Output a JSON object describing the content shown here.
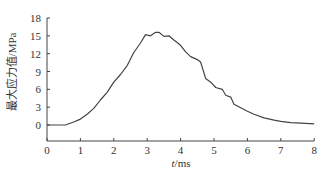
{
  "chart_data": {
    "type": "line",
    "title": "",
    "xlabel": "t/ms",
    "xlabel_italic_part": "t",
    "xlabel_rest": "/ms",
    "ylabel": "最大应力值/MPa",
    "xlim": [
      0,
      8
    ],
    "ylim": [
      -3,
      18
    ],
    "x_ticks": [
      0,
      1,
      2,
      3,
      4,
      5,
      6,
      7,
      8
    ],
    "y_ticks": [
      0,
      3,
      6,
      9,
      12,
      15,
      18
    ],
    "grid": false,
    "legend": null,
    "line_color": "#444444",
    "series": [
      {
        "name": "最大应力值",
        "x": [
          0,
          0.55,
          0.8,
          1.0,
          1.2,
          1.4,
          1.6,
          1.8,
          2.0,
          2.2,
          2.4,
          2.6,
          2.8,
          2.95,
          3.1,
          3.25,
          3.35,
          3.5,
          3.65,
          3.8,
          4.0,
          4.15,
          4.3,
          4.5,
          4.6,
          4.75,
          4.9,
          5.05,
          5.25,
          5.35,
          5.5,
          5.6,
          5.8,
          6.0,
          6.2,
          6.5,
          6.8,
          7.0,
          7.3,
          7.6,
          8.0
        ],
        "values": [
          0,
          0,
          0.5,
          1.0,
          1.8,
          2.8,
          4.2,
          5.5,
          7.2,
          8.5,
          10.0,
          12.2,
          13.8,
          15.2,
          15.0,
          15.6,
          15.6,
          14.9,
          15.0,
          14.3,
          13.4,
          12.3,
          11.5,
          11.0,
          10.6,
          7.8,
          7.2,
          6.3,
          6.0,
          5.0,
          4.7,
          3.5,
          2.9,
          2.3,
          1.8,
          1.2,
          0.8,
          0.6,
          0.4,
          0.3,
          0.2
        ]
      }
    ]
  }
}
